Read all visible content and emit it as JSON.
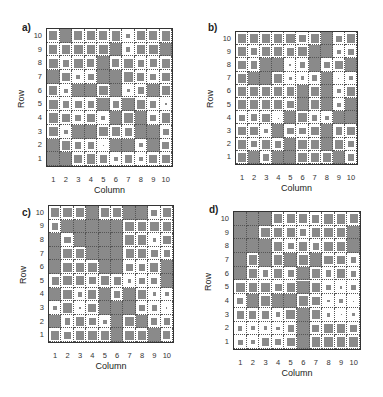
{
  "figure": {
    "panels": [
      {
        "label": "a)",
        "xlabel": "Column",
        "ylabel": "Row"
      },
      {
        "label": "b)",
        "xlabel": "Column",
        "ylabel": "Row"
      },
      {
        "label": "c)",
        "xlabel": "Column",
        "ylabel": "Row"
      },
      {
        "label": "d)",
        "xlabel": "Column",
        "ylabel": "Row"
      }
    ],
    "xticks": [
      "1",
      "2",
      "3",
      "4",
      "5",
      "6",
      "7",
      "8",
      "9",
      "10"
    ],
    "yticks": [
      "10",
      "9",
      "8",
      "7",
      "6",
      "5",
      "4",
      "3",
      "2",
      "1"
    ],
    "colors": {
      "fill": "#8a8a8a",
      "background": "#ffffff",
      "gridline": "#555555",
      "frame": "#333333"
    }
  },
  "chart_data": [
    {
      "type": "heatmap",
      "title": "a)",
      "xlabel": "Column",
      "ylabel": "Row",
      "x": [
        1,
        2,
        3,
        4,
        5,
        6,
        7,
        8,
        9,
        10
      ],
      "y_top_to_bottom": [
        10,
        9,
        8,
        7,
        6,
        5,
        4,
        3,
        2,
        1
      ],
      "encoding": "filled square size relative to cell (1.0 = full cell)",
      "values": [
        [
          0.75,
          1.0,
          0.75,
          0.75,
          0.75,
          0.8,
          0.35,
          0.75,
          0.75,
          0.8
        ],
        [
          0.75,
          0.75,
          0.8,
          0.75,
          0.8,
          1.0,
          0.35,
          0.8,
          0.8,
          1.0
        ],
        [
          0.8,
          0.6,
          0.8,
          0.65,
          1.0,
          0.65,
          0.8,
          0.6,
          0.65,
          0.8
        ],
        [
          1.0,
          0.75,
          0.35,
          0.55,
          1.0,
          1.0,
          0.8,
          0.65,
          0.55,
          0.75
        ],
        [
          0.75,
          0.35,
          1.0,
          1.0,
          0.8,
          1.0,
          0.3,
          0.6,
          1.0,
          0.75
        ],
        [
          0.8,
          0.6,
          0.65,
          0.55,
          1.0,
          0.6,
          1.0,
          0.8,
          0.6,
          0.15
        ],
        [
          0.8,
          0.75,
          0.55,
          0.75,
          0.35,
          1.0,
          0.8,
          1.0,
          0.55,
          0.8
        ],
        [
          0.8,
          0.35,
          1.0,
          1.0,
          0.8,
          0.8,
          0.65,
          1.0,
          1.0,
          0.55
        ],
        [
          1.0,
          0.75,
          0.55,
          0.55,
          0.1,
          1.0,
          1.0,
          0.35,
          1.0,
          0.65
        ],
        [
          1.0,
          1.0,
          0.75,
          0.8,
          0.65,
          0.35,
          0.65,
          0.35,
          0.75,
          0.75
        ]
      ],
      "xlim": [
        0.5,
        10.5
      ],
      "ylim": [
        0.5,
        10.5
      ],
      "grid": true
    },
    {
      "type": "heatmap",
      "title": "b)",
      "xlabel": "Column",
      "ylabel": "Row",
      "x": [
        1,
        2,
        3,
        4,
        5,
        6,
        7,
        8,
        9,
        10
      ],
      "y_top_to_bottom": [
        10,
        9,
        8,
        7,
        6,
        5,
        4,
        3,
        2,
        1
      ],
      "encoding": "filled square size relative to cell (1.0 = full cell)",
      "values": [
        [
          0.8,
          0.8,
          0.8,
          0.8,
          0.8,
          0.65,
          0.8,
          1.0,
          0.55,
          0.75
        ],
        [
          0.8,
          0.6,
          0.8,
          0.8,
          0.75,
          0.8,
          1.0,
          1.0,
          0.35,
          0.55
        ],
        [
          0.75,
          0.65,
          1.0,
          1.0,
          0.2,
          0.5,
          1.0,
          0.55,
          0.8,
          1.0
        ],
        [
          0.8,
          1.0,
          1.0,
          0.8,
          0.3,
          0.35,
          0.55,
          1.0,
          0.1,
          0.4
        ],
        [
          0.8,
          0.8,
          0.8,
          0.8,
          0.75,
          1.0,
          0.8,
          1.0,
          0.35,
          0.75
        ],
        [
          0.8,
          0.8,
          0.75,
          0.8,
          0.6,
          1.0,
          0.8,
          1.0,
          0.35,
          1.0
        ],
        [
          0.5,
          0.65,
          0.75,
          0.05,
          1.0,
          0.8,
          0.55,
          0.4,
          1.0,
          1.0
        ],
        [
          0.8,
          0.75,
          0.4,
          1.0,
          0.6,
          0.6,
          0.8,
          1.0,
          0.65,
          0.8
        ],
        [
          0.8,
          0.55,
          0.8,
          0.6,
          1.0,
          0.8,
          0.8,
          1.0,
          0.8,
          0.5
        ],
        [
          0.8,
          1.0,
          0.6,
          1.0,
          1.0,
          0.8,
          0.8,
          0.8,
          1.0,
          0.65
        ]
      ],
      "xlim": [
        0.5,
        10.5
      ],
      "ylim": [
        0.5,
        10.5
      ],
      "grid": true
    },
    {
      "type": "heatmap",
      "title": "c)",
      "xlabel": "Column",
      "ylabel": "Row",
      "x": [
        1,
        2,
        3,
        4,
        5,
        6,
        7,
        8,
        9,
        10
      ],
      "y_top_to_bottom": [
        10,
        9,
        8,
        7,
        6,
        5,
        4,
        3,
        2,
        1
      ],
      "encoding": "filled square size relative to cell (1.0 = full cell)",
      "values": [
        [
          0.75,
          0.8,
          0.8,
          1.0,
          0.75,
          0.8,
          1.0,
          1.0,
          0.55,
          0.75
        ],
        [
          0.55,
          1.0,
          1.0,
          1.0,
          1.0,
          1.0,
          0.8,
          0.8,
          0.8,
          0.8
        ],
        [
          1.0,
          0.6,
          1.0,
          1.0,
          1.0,
          1.0,
          0.8,
          0.8,
          0.3,
          0.75
        ],
        [
          1.0,
          0.8,
          0.8,
          1.0,
          1.0,
          1.0,
          0.75,
          0.8,
          0.6,
          0.55
        ],
        [
          1.0,
          0.8,
          0.8,
          0.8,
          1.0,
          1.0,
          0.6,
          0.6,
          0.75,
          1.0
        ],
        [
          0.65,
          0.8,
          0.75,
          0.6,
          0.8,
          0.65,
          0.35,
          0.5,
          0.55,
          1.0
        ],
        [
          1.0,
          0.8,
          0.45,
          0.75,
          1.0,
          0.55,
          1.0,
          0.8,
          0.35,
          0.35
        ],
        [
          0.35,
          0.8,
          0.1,
          0.75,
          1.0,
          1.0,
          1.0,
          0.6,
          0.5,
          0.1
        ],
        [
          1.0,
          0.55,
          0.8,
          0.6,
          0.35,
          1.0,
          0.8,
          1.0,
          0.55,
          0.6
        ],
        [
          0.8,
          0.6,
          0.75,
          0.8,
          0.75,
          1.0,
          0.8,
          0.8,
          1.0,
          0.65
        ]
      ],
      "xlim": [
        0.5,
        10.5
      ],
      "ylim": [
        0.5,
        10.5
      ],
      "grid": true
    },
    {
      "type": "heatmap",
      "title": "d)",
      "xlabel": "Column",
      "ylabel": "Row",
      "x": [
        1,
        2,
        3,
        4,
        5,
        6,
        7,
        8,
        9,
        10
      ],
      "y_top_to_bottom": [
        10,
        9,
        8,
        7,
        6,
        5,
        4,
        3,
        2,
        1
      ],
      "encoding": "filled square size relative to cell (1.0 = full cell)",
      "values": [
        [
          1.0,
          1.0,
          1.0,
          0.75,
          0.75,
          0.75,
          0.65,
          0.8,
          0.8,
          0.75
        ],
        [
          1.0,
          1.0,
          0.8,
          0.75,
          0.75,
          0.55,
          0.75,
          0.8,
          0.75,
          1.0
        ],
        [
          1.0,
          1.0,
          1.0,
          0.75,
          0.55,
          0.75,
          0.6,
          0.75,
          0.75,
          1.0
        ],
        [
          1.0,
          0.8,
          1.0,
          0.8,
          1.0,
          0.8,
          1.0,
          0.75,
          0.75,
          0.5
        ],
        [
          1.0,
          0.8,
          0.55,
          0.8,
          0.55,
          1.0,
          0.8,
          0.55,
          0.8,
          0.5
        ],
        [
          0.8,
          0.8,
          0.8,
          0.65,
          0.75,
          1.0,
          0.75,
          0.45,
          0.2,
          0.45
        ],
        [
          0.55,
          1.0,
          0.8,
          1.0,
          1.0,
          0.8,
          0.75,
          0.25,
          0.3,
          0.08
        ],
        [
          0.65,
          0.65,
          0.65,
          0.45,
          0.8,
          1.0,
          0.8,
          0.35,
          0.08,
          0.3
        ],
        [
          0.4,
          0.35,
          0.35,
          0.3,
          0.55,
          1.0,
          0.65,
          0.75,
          0.8,
          0.65
        ],
        [
          0.45,
          0.35,
          0.65,
          0.55,
          0.75,
          1.0,
          0.8,
          0.8,
          0.8,
          0.8
        ]
      ],
      "xlim": [
        0.5,
        10.5
      ],
      "ylim": [
        0.5,
        10.5
      ],
      "grid": true
    }
  ]
}
